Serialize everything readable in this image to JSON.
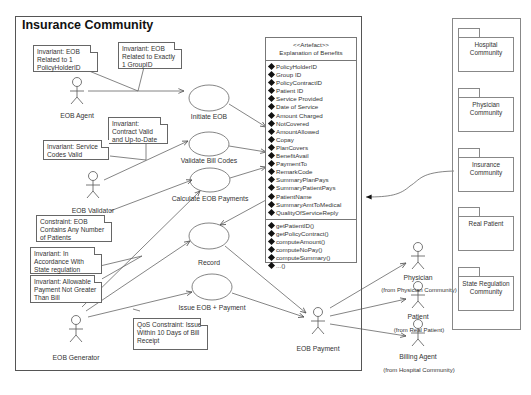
{
  "frame": {
    "title": "Insurance Community"
  },
  "actors": {
    "eob_agent": "EOB Agent",
    "eob_validator": "EOB Validator",
    "eob_generator": "EOB Generator",
    "eob_payment": "EOB Payment",
    "physician": "Physician",
    "physician_from": "(from Physician Community)",
    "patient": "Patient",
    "patient_from": "(from Real Patient)",
    "billing_agent": "Billing Agent",
    "billing_agent_from": "(from Hospital Community)"
  },
  "use_cases": {
    "initiate": "Initiate EOB",
    "validate": "Validate Bill Codes",
    "calculate": "Calculate EOB Payments",
    "record": "Record",
    "issue": "Issue EOB + Payment"
  },
  "notes": {
    "n1": "Invariant: EOB Related to 1 PolicyHolderID",
    "n2": "Invariant: EOB Related to Exactly 1 GroupID",
    "n3": "Invariant: Contract Valid and Up-to-Date",
    "n4": "Invariant: Service Codes Valid",
    "n5": "Constraint: EOB Contains Any Number of Patients",
    "n6": "Invariant: In Accordance With State regulation",
    "n7": "Invariant: Allowable Payment Not Greater Than Bill",
    "n8": "QoS Constraint: Issue Within 10 Days of Bill Receipt"
  },
  "artifact": {
    "stereotype": "<<Artefact>>",
    "name": "Explanation of Benefits",
    "attributes": [
      "PolicyHolderID",
      "Group ID",
      "PolicyContractID",
      "Patient ID",
      "Service Provided",
      "Date of Service",
      "Amount Charged",
      "NotCovered",
      "AmountAllowed",
      "Copay",
      "PlanCovers",
      "BenefitAvail",
      "PaymentTo",
      "RemarkCode",
      "SummaryPlanPays",
      "SummaryPatientPays",
      "PatientName",
      "SummaryAmtToMedical",
      "QualityOfServiceReply"
    ],
    "operations": [
      "getPatientID()",
      "getPolicyContract()",
      "computeAmount()",
      "computeNoPay()",
      "computeSummary()",
      "...()"
    ]
  },
  "packages": [
    "Hospital Community",
    "Physician Community",
    "Insurance Community",
    "Real Patient",
    "State Regulation Community"
  ]
}
